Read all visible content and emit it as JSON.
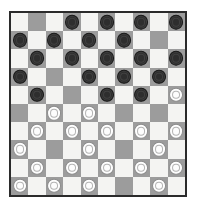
{
  "board": {
    "title": "Draughts Board",
    "game": "International Draughts",
    "rows": 10,
    "columns": 10,
    "colors": {
      "light_square": "#f4f4f2",
      "dark_square": "#9c9c9c",
      "border": "#2b2b2b",
      "black_piece": "#2e2e2e",
      "white_piece": "#fdfdfd",
      "background": "#ffffff"
    },
    "piece_labels": {
      "black": "black-piece",
      "white": "white-piece",
      "empty": "empty-square"
    },
    "counts": {
      "black_pieces": 21,
      "white_pieces": 24
    },
    "squares": [
      [
        "",
        "",
        "",
        "b",
        "",
        "b",
        "",
        "b",
        "",
        "b"
      ],
      [
        "b",
        "",
        "b",
        "",
        "b",
        "",
        "b",
        "",
        "",
        ""
      ],
      [
        "",
        "b",
        "",
        "b",
        "",
        "b",
        "",
        "b",
        "",
        "b"
      ],
      [
        "b",
        "",
        "",
        "",
        "b",
        "",
        "b",
        "",
        "b",
        ""
      ],
      [
        "",
        "b",
        "",
        "",
        "",
        "b",
        "",
        "b",
        "",
        "w"
      ],
      [
        "",
        "",
        "w",
        "",
        "w",
        "",
        "",
        "",
        "",
        ""
      ],
      [
        "",
        "w",
        "",
        "w",
        "",
        "w",
        "",
        "w",
        "",
        "w"
      ],
      [
        "w",
        "",
        "",
        "",
        "w",
        "",
        "",
        "",
        "w",
        ""
      ],
      [
        "",
        "w",
        "",
        "w",
        "",
        "w",
        "",
        "w",
        "",
        "w"
      ],
      [
        "w",
        "",
        "w",
        "",
        "w",
        "",
        "",
        "",
        "w",
        ""
      ]
    ]
  }
}
